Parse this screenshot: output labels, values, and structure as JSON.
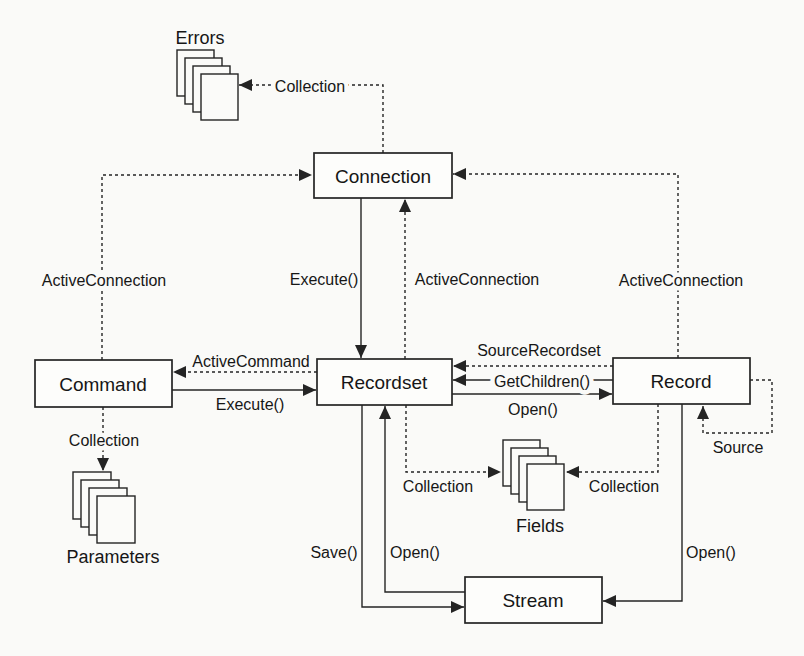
{
  "figure": {
    "background": "#fafaf8",
    "ink_color": "#242424",
    "nodes": {
      "connection": "Connection",
      "command": "Command",
      "recordset": "Recordset",
      "record": "Record",
      "stream": "Stream"
    },
    "collections": {
      "errors": "Errors",
      "parameters": "Parameters",
      "fields": "Fields"
    },
    "edges": {
      "errors_collection": "Collection",
      "command_active_connection": "ActiveConnection",
      "recordset_active_connection": "ActiveConnection",
      "record_active_connection": "ActiveConnection",
      "connection_execute": "Execute()",
      "active_command": "ActiveCommand",
      "command_execute": "Execute()",
      "source_recordset": "SourceRecordset",
      "get_children": "GetChildren()",
      "recordset_open_record": "Open()",
      "record_source": "Source",
      "command_collection": "Collection",
      "recordset_fields_collection": "Collection",
      "record_fields_collection": "Collection",
      "recordset_save": "Save()",
      "stream_open_recordset": "Open()",
      "record_open_stream": "Open()"
    }
  }
}
